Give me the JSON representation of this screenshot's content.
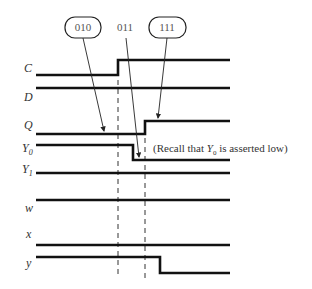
{
  "diagram": {
    "type": "timing-diagram",
    "state_labels": [
      {
        "text": "010",
        "boxed": true
      },
      {
        "text": "011",
        "boxed": false
      },
      {
        "text": "111",
        "boxed": true
      }
    ],
    "signals": [
      {
        "name": "C",
        "sub": "",
        "waveform": "low -> high at t1"
      },
      {
        "name": "D",
        "sub": "",
        "waveform": "high constant"
      },
      {
        "name": "Q",
        "sub": "",
        "waveform": "low -> high at t2"
      },
      {
        "name": "Y",
        "sub": "0",
        "waveform": "high -> low between t1 and t2"
      },
      {
        "name": "Y",
        "sub": "1",
        "waveform": "high constant"
      },
      {
        "name": "w",
        "sub": "",
        "waveform": "high constant"
      },
      {
        "name": "x",
        "sub": "",
        "waveform": "low constant"
      },
      {
        "name": "y",
        "sub": "",
        "waveform": "high -> low after t2"
      }
    ],
    "note": {
      "prefix": "(Recall that ",
      "signal": "Y",
      "sub": "0",
      "suffix": " is asserted low)"
    }
  }
}
